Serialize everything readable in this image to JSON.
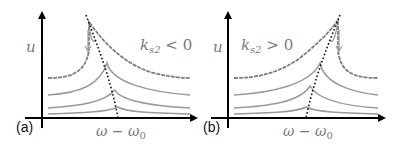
{
  "panels": [
    {
      "id": "a",
      "label": "(a)",
      "y_axis_label": "u",
      "x_axis_label": "ω − ω",
      "x_axis_sub": "0",
      "annotation_main": "k",
      "annotation_sub": "s2",
      "annotation_rel": " < 0"
    },
    {
      "id": "b",
      "label": "(b)",
      "y_axis_label": "u",
      "x_axis_label": "ω − ω",
      "x_axis_sub": "0",
      "annotation_main": "k",
      "annotation_sub": "s2",
      "annotation_rel": " > 0"
    }
  ],
  "colors": {
    "axis": "#000000",
    "curve": "#9a9a9a",
    "top_curve": "#7d7d7d",
    "dotted": "#111111",
    "label": "#7a7a7a"
  }
}
